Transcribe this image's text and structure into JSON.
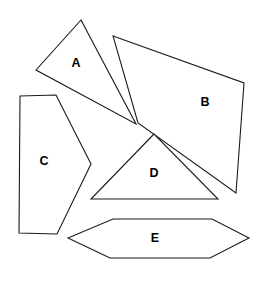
{
  "figure": {
    "background_color": "#ffffff",
    "stroke_color": "#1a1a1a",
    "label_color": "#000000",
    "width": 261,
    "height": 288
  },
  "shapes": [
    {
      "id": "A",
      "label": "A",
      "kind": "triangle",
      "points": "81,20 36,70 136,124",
      "label_x": 76,
      "label_y": 64
    },
    {
      "id": "B",
      "label": "B",
      "kind": "quadrilateral",
      "points": "113,36 244,83 236,193 138,123",
      "label_x": 205,
      "label_y": 103
    },
    {
      "id": "C",
      "label": "C",
      "kind": "concave-polygon",
      "points": "20,96 56,95 91,164 57,234 19,233",
      "label_x": 44,
      "label_y": 162
    },
    {
      "id": "D",
      "label": "D",
      "kind": "triangle",
      "points": "154,134 91,199 218,199",
      "label_x": 154,
      "label_y": 174
    },
    {
      "id": "E",
      "label": "E",
      "kind": "hexagon",
      "points": "113,219 212,219 249,238 210,258 110,258 68,238",
      "label_x": 155,
      "label_y": 239
    }
  ]
}
